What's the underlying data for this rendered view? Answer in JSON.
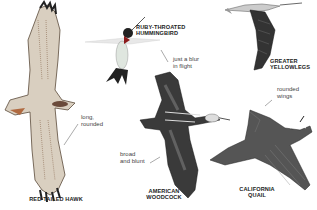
{
  "birds": [
    {
      "name_line1": "RED-TAILED HAWK",
      "name_line2": "",
      "note": [
        "long,",
        "rounded"
      ]
    },
    {
      "name_line1": "RUBY-THROATED",
      "name_line2": "HUMMINGBIRD",
      "note": [
        "just a blur",
        "in flight"
      ]
    },
    {
      "name_line1": "GREATER",
      "name_line2": "YELLOWLEGS",
      "note": []
    },
    {
      "name_line1": "AMERICAN",
      "name_line2": "WOODCOCK",
      "note": [
        "broad",
        "and blunt"
      ]
    },
    {
      "name_line1": "CALIFORNIA",
      "name_line2": "QUAIL",
      "note": [
        "rounded",
        "wings"
      ]
    }
  ]
}
